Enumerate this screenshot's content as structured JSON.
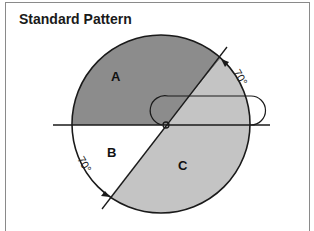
{
  "title": "Standard Pattern",
  "regions": {
    "a": {
      "label": "A",
      "color": "#8c8c8c"
    },
    "b": {
      "label": "B",
      "color": "#ffffff"
    },
    "c": {
      "label": "C",
      "color": "#c4c4c4"
    }
  },
  "angles": {
    "upper": "70°",
    "lower": "70°"
  },
  "colors": {
    "stroke": "#1a1a1a",
    "frame": "#8a8a8a"
  }
}
